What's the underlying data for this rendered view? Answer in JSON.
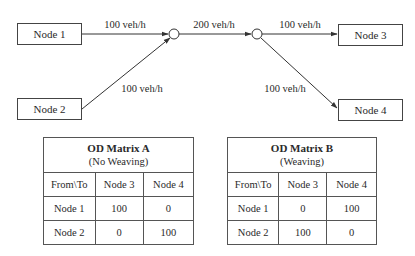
{
  "diagram": {
    "nodes": [
      {
        "id": "node1",
        "label": "Node 1"
      },
      {
        "id": "node2",
        "label": "Node 2"
      },
      {
        "id": "node3",
        "label": "Node 3"
      },
      {
        "id": "node4",
        "label": "Node 4"
      }
    ],
    "links": [
      {
        "from": "node1",
        "to": "junction1",
        "label": "100 veh/h"
      },
      {
        "from": "node2",
        "to": "junction1",
        "label": "100 veh/h"
      },
      {
        "from": "junction1",
        "to": "junction2",
        "label": "200 veh/h"
      },
      {
        "from": "junction2",
        "to": "node3",
        "label": "100 veh/h"
      },
      {
        "from": "junction2",
        "to": "node4",
        "label": "100 veh/h"
      }
    ]
  },
  "tables": [
    {
      "id": "od-matrix-a",
      "title": "OD Matrix A",
      "subtitle": "(No Weaving)",
      "headers": [
        "From\\To",
        "Node 3",
        "Node 4"
      ],
      "rows": [
        [
          "Node 1",
          "100",
          "0"
        ],
        [
          "Node 2",
          "0",
          "100"
        ]
      ]
    },
    {
      "id": "od-matrix-b",
      "title": "OD Matrix B",
      "subtitle": "(Weaving)",
      "headers": [
        "From\\To",
        "Node 3",
        "Node 4"
      ],
      "rows": [
        [
          "Node 1",
          "0",
          "100"
        ],
        [
          "Node 2",
          "100",
          "0"
        ]
      ]
    }
  ]
}
